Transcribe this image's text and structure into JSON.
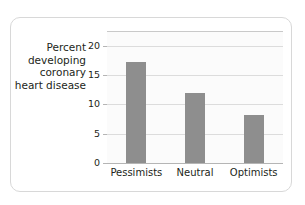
{
  "chart_data": {
    "type": "bar",
    "title": "",
    "xlabel": "",
    "ylabel": "Percent\ndeveloping\ncoronary\nheart disease",
    "categories": [
      "Pessimists",
      "Neutral",
      "Optimists"
    ],
    "values": [
      17.3,
      11.9,
      8.2
    ],
    "ylim": [
      0,
      22.5
    ],
    "yticks": [
      0,
      5,
      10,
      15,
      20
    ],
    "ytick_labels": [
      "0",
      "5",
      "10",
      "15",
      "20"
    ],
    "grid": true,
    "grid_axis": "y",
    "legend": false,
    "bar_color": "#8e8e8e",
    "plot_bg": "#fbfbfb",
    "axis_color": "#b5b5b5",
    "grid_color": "#dcdcdc",
    "card_border_color": "#d8d8d8",
    "text_color": "#231f20"
  }
}
